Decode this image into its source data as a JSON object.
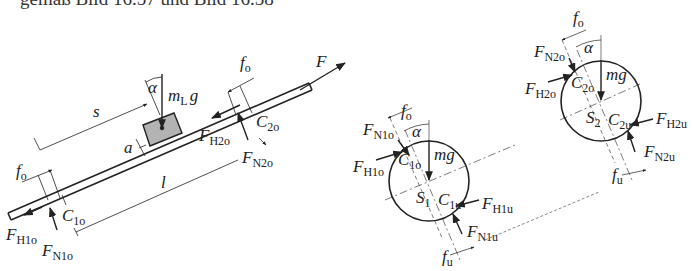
{
  "caption": "gemäß Bild 16.57 und Bild 16.58",
  "colors": {
    "line": "#222222",
    "block_fill": "#b3b3b3",
    "background": "#ffffff"
  },
  "left_figure": {
    "labels": {
      "F": "F",
      "m": "m",
      "mL_sub": "L",
      "g": "g",
      "alpha": "α",
      "s": "s",
      "a": "a",
      "l": "l",
      "fo_top": "f",
      "fo_top_sub": "o",
      "fo_left": "f",
      "fo_left_sub": "o",
      "C2o": "C",
      "C2o_sub": "2o",
      "FH2o": "F",
      "FH2o_sub": "H2o",
      "FN2o": "F",
      "FN2o_sub": "N2o",
      "C1o": "C",
      "C1o_sub": "1o",
      "FH1o": "F",
      "FH1o_sub": "H1o",
      "FN1o": "F",
      "FN1o_sub": "N1o"
    }
  },
  "roller1": {
    "labels": {
      "fo": "f",
      "fo_sub": "o",
      "alpha": "α",
      "FN1o": "F",
      "FN1o_sub": "N1o",
      "FH1o": "F",
      "FH1o_sub": "H1o",
      "C1o": "C",
      "C1o_sub": "1o",
      "mg": "mg",
      "S1": "S",
      "S1_sub": "1",
      "C1u": "C",
      "C1u_sub": "1u",
      "FH1u": "F",
      "FH1u_sub": "H1u",
      "FN1u": "F",
      "FN1u_sub": "N1u",
      "fu": "f",
      "fu_sub": "u"
    }
  },
  "roller2": {
    "labels": {
      "fo": "f",
      "fo_sub": "o",
      "alpha": "α",
      "FN2o": "F",
      "FN2o_sub": "N2o",
      "FH2o": "F",
      "FH2o_sub": "H2o",
      "C2o": "C",
      "C2o_sub": "2o",
      "mg": "mg",
      "S2": "S",
      "S2_sub": "2",
      "C2u": "C",
      "C2u_sub": "2u",
      "FH2u": "F",
      "FH2u_sub": "H2u",
      "FN2u": "F",
      "FN2u_sub": "N2u",
      "fu": "f",
      "fu_sub": "u"
    }
  }
}
